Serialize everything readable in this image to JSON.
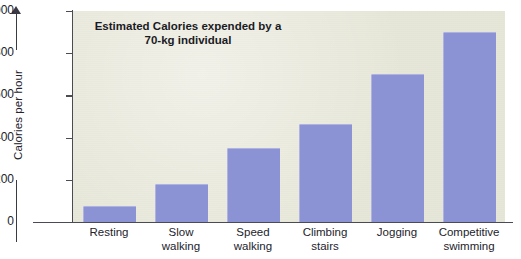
{
  "chart_data": {
    "type": "bar",
    "title": "Estimated Calories expended by a 70-kg individual",
    "title_line1": "Estimated Calories expended",
    "title_line2": "by a 70-kg individual",
    "xlabel": "",
    "ylabel": "Calories per hour",
    "ylim": [
      0,
      1000
    ],
    "ytick_values": [
      0,
      200,
      400,
      600,
      800,
      1000
    ],
    "ytick_labels": [
      "0",
      "200",
      "400",
      "600",
      "800",
      "1000"
    ],
    "grid": false,
    "legend": "none",
    "bar_color": "#8b93d4",
    "plot_background": "#e7e7d9",
    "categories": [
      "Resting",
      "Slow walking",
      "Speed walking",
      "Climbing stairs",
      "Jogging",
      "Competitive swimming"
    ],
    "category_lines": [
      [
        "Resting"
      ],
      [
        "Slow",
        "walking"
      ],
      [
        "Speed",
        "walking"
      ],
      [
        "Climbing",
        "stairs"
      ],
      [
        "Jogging"
      ],
      [
        "Competitive",
        "swimming"
      ]
    ],
    "values": [
      75,
      180,
      350,
      465,
      700,
      900
    ]
  }
}
